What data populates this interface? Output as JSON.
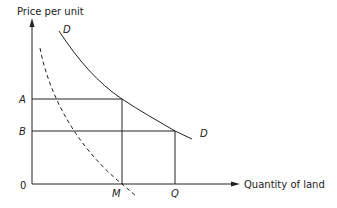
{
  "diagram": {
    "y_axis_label": "Price per unit",
    "x_axis_label": "Quantity of land",
    "origin_label": "0",
    "price_labels": {
      "a": "A",
      "b": "B"
    },
    "quantity_labels": {
      "m": "M",
      "q": "Q"
    },
    "curve_labels": {
      "d_top": "D",
      "d_end": "D"
    },
    "curves": [
      {
        "name": "demand-curve",
        "style": "solid",
        "passes_through": [
          "(M, A)",
          "(Q, B)"
        ]
      },
      {
        "name": "marginal-curve",
        "style": "dashed",
        "passes_through": [
          "(M, 0)"
        ]
      }
    ],
    "colors": {
      "line": "#222222",
      "background": "#ffffff"
    }
  }
}
